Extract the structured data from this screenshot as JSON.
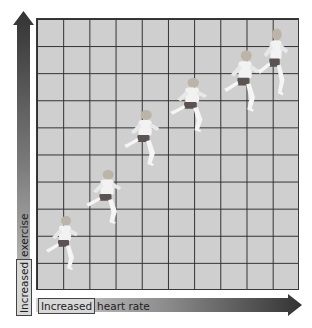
{
  "figure": {
    "y_axis_label_word1": "Increased",
    "y_axis_label_word2": "exercise",
    "x_axis_label_word1": "Increased",
    "x_axis_label_word2": "heart rate",
    "grid": {
      "columns": 10,
      "rows": 10,
      "background": "#cfcfcf",
      "line_color": "#2e2e2e"
    },
    "arrow_gradient": {
      "light": "#c8c8c8",
      "dark": "#3a3a3a"
    },
    "runners": [
      {
        "id": 1,
        "x": 44,
        "y": 214,
        "w": 40,
        "h": 58
      },
      {
        "id": 2,
        "x": 84,
        "y": 168,
        "w": 44,
        "h": 58
      },
      {
        "id": 3,
        "x": 122,
        "y": 108,
        "w": 44,
        "h": 60
      },
      {
        "id": 4,
        "x": 168,
        "y": 76,
        "w": 46,
        "h": 58
      },
      {
        "id": 5,
        "x": 222,
        "y": 48,
        "w": 44,
        "h": 66
      },
      {
        "id": 6,
        "x": 256,
        "y": 26,
        "w": 38,
        "h": 72
      }
    ]
  }
}
